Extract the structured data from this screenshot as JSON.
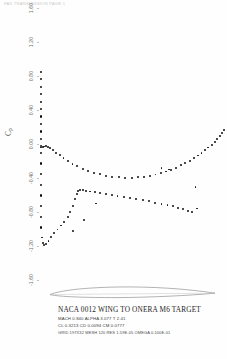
{
  "scan": {
    "header_text": "FAX TRANSMISSION   PAGE  1"
  },
  "plot": {
    "ylabel": "Cp",
    "ylabel_main": "C",
    "ylabel_sub": "p"
  },
  "caption": {
    "title": "NACA 0012 WING TO ONERA M6 TARGET",
    "line2": "MACH 0.840   ALPHA 3.077    T    2.41",
    "line3": "CL  0.3213   CD  0.0094   CM  0.0777",
    "line4": "GRID 197X32   MESH    120  RES 1.59E-05  OMEGA 0.100E-01"
  },
  "chart_data": {
    "type": "scatter",
    "title": "NACA 0012 WING TO ONERA M6 TARGET",
    "xlabel": "",
    "ylabel": "Cp",
    "ylim": [
      1.6,
      -1.6
    ],
    "yticks": [
      -1.6,
      -1.2,
      -0.8,
      -0.4,
      0.0,
      0.4,
      0.8,
      1.2,
      1.6
    ],
    "ytick_labels": [
      "-1.60",
      "-1.20",
      "-0.80",
      "-0.40",
      "0.00",
      "0.40",
      "0.80",
      "1.20",
      "1.60"
    ],
    "xlim": [
      0.0,
      1.0
    ],
    "grid": false,
    "legend": "none",
    "note": "Pressure coefficient distribution. Cp axis is inverted (negative up).",
    "series": [
      {
        "name": "upper-surface",
        "marker": "filled-circle",
        "color": "#111111",
        "x": [
          0.01,
          0.016,
          0.024,
          0.034,
          0.046,
          0.06,
          0.076,
          0.094,
          0.112,
          0.13,
          0.148,
          0.163,
          0.176,
          0.187,
          0.196,
          0.205,
          0.216,
          0.23,
          0.248,
          0.27,
          0.295,
          0.322,
          0.352,
          0.383,
          0.415,
          0.448,
          0.482,
          0.516,
          0.55,
          0.584,
          0.617,
          0.65,
          0.682,
          0.712,
          0.74,
          0.766,
          0.79,
          0.812
        ],
        "y": [
          -1.1,
          -1.168,
          -1.19,
          -1.175,
          -1.14,
          -1.096,
          -1.052,
          -1.006,
          -0.96,
          -0.914,
          -0.862,
          -0.8,
          -0.726,
          -0.648,
          -0.59,
          -0.558,
          -0.546,
          -0.546,
          -0.552,
          -0.56,
          -0.57,
          -0.58,
          -0.592,
          -0.604,
          -0.616,
          -0.628,
          -0.64,
          -0.652,
          -0.664,
          -0.676,
          -0.69,
          -0.704,
          -0.718,
          -0.734,
          -0.75,
          -0.768,
          -0.786,
          -0.804
        ]
      },
      {
        "name": "lower-surface",
        "marker": "filled-circle",
        "color": "#111111",
        "x": [
          0.008,
          0.014,
          0.021,
          0.03,
          0.041,
          0.054,
          0.069,
          0.086,
          0.105,
          0.126,
          0.149,
          0.174,
          0.2,
          0.228,
          0.257,
          0.288,
          0.32,
          0.353,
          0.387,
          0.421,
          0.456,
          0.49,
          0.524,
          0.556,
          0.588,
          0.618,
          0.648,
          0.676,
          0.703,
          0.729,
          0.754,
          0.778,
          0.801,
          0.823,
          0.844,
          0.864,
          0.883,
          0.901,
          0.918,
          0.934,
          0.949,
          0.962,
          0.974,
          0.984
        ],
        "y": [
          -0.042,
          -0.036,
          -0.03,
          -0.028,
          -0.034,
          -0.05,
          -0.074,
          -0.102,
          -0.134,
          -0.168,
          -0.202,
          -0.234,
          -0.264,
          -0.292,
          -0.318,
          -0.34,
          -0.358,
          -0.372,
          -0.384,
          -0.392,
          -0.396,
          -0.396,
          -0.392,
          -0.384,
          -0.374,
          -0.36,
          -0.344,
          -0.324,
          -0.302,
          -0.278,
          -0.252,
          -0.224,
          -0.196,
          -0.166,
          -0.136,
          -0.106,
          -0.074,
          -0.042,
          -0.008,
          0.026,
          0.06,
          0.094,
          0.128,
          0.16
        ]
      },
      {
        "name": "leading-edge-column",
        "marker": "filled-circle",
        "color": "#111111",
        "x": [
          0.004,
          0.004,
          0.004,
          0.004,
          0.004,
          0.004,
          0.004,
          0.004,
          0.004,
          0.004,
          0.004,
          0.004,
          0.004,
          0.004,
          0.004,
          0.004,
          0.004,
          0.004,
          0.004
        ],
        "y": [
          -0.98,
          -0.856,
          -0.73,
          -0.604,
          -0.478,
          -0.352,
          -0.226,
          -0.1,
          -0.02,
          0.06,
          0.148,
          0.236,
          0.324,
          0.412,
          0.5,
          0.588,
          0.676,
          0.764,
          0.852
        ]
      },
      {
        "name": "outliers",
        "marker": "filled-circle",
        "color": "#111111",
        "x": [
          0.178,
          0.236,
          0.3,
          0.838,
          0.832,
          0.65,
          0.69
        ],
        "y": [
          -1.02,
          -0.89,
          -0.7,
          -0.76,
          -0.508,
          -0.286,
          -0.3
        ]
      }
    ]
  }
}
